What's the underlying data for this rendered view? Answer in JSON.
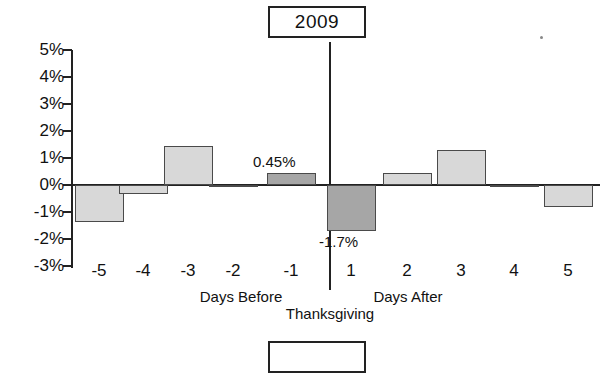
{
  "chart_data": {
    "type": "bar",
    "title": "2009",
    "xlabel": "Thanksgiving",
    "ylabel": "",
    "categories": [
      "-5",
      "-4",
      "-3",
      "-2",
      "-1",
      "1",
      "2",
      "3",
      "4",
      "5"
    ],
    "values": [
      -1.35,
      -0.35,
      1.45,
      0.0,
      0.45,
      -1.7,
      0.45,
      1.3,
      0.0,
      -0.8
    ],
    "data_labels": [
      "",
      "",
      "",
      "",
      "0.45%",
      "-1.7%",
      "",
      "",
      "",
      ""
    ],
    "highlighted": [
      false,
      false,
      false,
      false,
      true,
      true,
      false,
      false,
      false,
      false
    ],
    "ylim": [
      -3,
      5
    ],
    "ytick_values": [
      5,
      4,
      3,
      2,
      1,
      0,
      -1,
      -2,
      -3
    ],
    "ytick_labels": [
      "5%",
      "4%",
      "3%",
      "2%",
      "1%",
      "0%",
      "-1%",
      "-2%",
      "-3%"
    ],
    "grid": false,
    "legend": "none",
    "group_labels": [
      "Days Before",
      "Days After"
    ],
    "colors": {
      "bar_light": "#d8d8d8",
      "bar_dark": "#a6a6a6",
      "bar_border": "#4a4a4a",
      "axis": "#222222",
      "text": "#111111"
    }
  },
  "title_box": {
    "label": "2009"
  },
  "next_title_box": {
    "label": ""
  },
  "axis": {
    "group_before": "Days Before",
    "group_after": "Days After",
    "main_label": "Thanksgiving"
  }
}
